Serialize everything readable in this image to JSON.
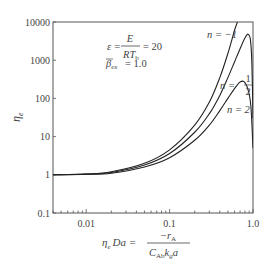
{
  "chart_data": {
    "type": "line",
    "title": "",
    "xlabel": "η_e Da = −r_A / (C_Ab k_g a)",
    "ylabel": "η_e",
    "xscale": "log",
    "yscale": "log",
    "xlim": [
      0.004,
      1.0
    ],
    "ylim": [
      0.1,
      10000
    ],
    "grid": false,
    "legend_position": "inline labels near right edge",
    "x_tick_labels": [
      "0.01",
      "0.1",
      "1.0"
    ],
    "y_tick_labels": [
      "0.1",
      "1",
      "10",
      "100",
      "1000",
      "10000"
    ],
    "annotations": [
      "ε = E / (R T_b) = 20",
      "β̄_ex = 1.0"
    ],
    "series": [
      {
        "name": "n = −1",
        "x": [
          0.004,
          0.01,
          0.02,
          0.05,
          0.1,
          0.2,
          0.3,
          0.4,
          0.5,
          0.6,
          0.65
        ],
        "y": [
          1.0,
          1.05,
          1.2,
          2.0,
          4.5,
          20,
          80,
          350,
          1500,
          6000,
          10000
        ]
      },
      {
        "name": "n = 1/2",
        "x": [
          0.004,
          0.01,
          0.02,
          0.05,
          0.1,
          0.2,
          0.3,
          0.4,
          0.5,
          0.6,
          0.7,
          0.8,
          0.87,
          0.93,
          0.97,
          1.0
        ],
        "y": [
          1.0,
          1.04,
          1.15,
          1.8,
          3.6,
          13,
          40,
          120,
          350,
          900,
          2000,
          3800,
          4800,
          3500,
          800,
          30
        ]
      },
      {
        "name": "n = 2",
        "x": [
          0.004,
          0.01,
          0.02,
          0.05,
          0.1,
          0.2,
          0.3,
          0.4,
          0.5,
          0.6,
          0.7,
          0.8,
          0.9,
          0.95,
          1.0
        ],
        "y": [
          1.0,
          1.03,
          1.1,
          1.6,
          2.8,
          8,
          20,
          48,
          100,
          180,
          270,
          260,
          130,
          50,
          5
        ]
      }
    ]
  },
  "labels": {
    "y_axis": "η",
    "y_axis_sub": "e",
    "x_axis_lhs_eta": "η",
    "x_axis_lhs_sub": "e",
    "x_axis_lhs_rest": "Da =",
    "x_axis_num": "−r",
    "x_axis_num_sub": "A",
    "x_axis_den_c": "C",
    "x_axis_den_c_sub": "Ab",
    "x_axis_den_k": "k",
    "x_axis_den_k_sub": "g",
    "x_axis_den_a": "a",
    "eps_lhs": "ε =",
    "eps_num": "E",
    "eps_den": "RT",
    "eps_den_sub": "b",
    "eps_rhs": "= 20",
    "beta_sym": "β",
    "beta_sub": "ex",
    "beta_rhs": "= 1.0",
    "n_neg1": "n = −1",
    "n_half_lhs": "n =",
    "n_half_num": "1",
    "n_half_den": "2",
    "n_two": "n = 2"
  },
  "colors": {
    "axis": "#555555",
    "curve": "#222222",
    "text": "#444444"
  }
}
